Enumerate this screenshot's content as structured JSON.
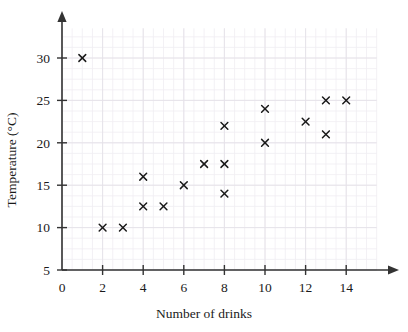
{
  "chart_data": {
    "type": "scatter",
    "title": "",
    "xlabel": "Number of drinks",
    "ylabel": "Temperature (°C)",
    "xlim": [
      0,
      15.5
    ],
    "ylim": [
      5,
      33.5
    ],
    "xticks": [
      0,
      2,
      4,
      6,
      8,
      10,
      12,
      14
    ],
    "yticks": [
      5,
      10,
      15,
      20,
      25,
      30
    ],
    "xtick_labels": [
      "0",
      "2",
      "4",
      "6",
      "8",
      "10",
      "12",
      "14"
    ],
    "ytick_labels": [
      "5",
      "10",
      "15",
      "20",
      "25",
      "30"
    ],
    "grid": true,
    "grid_minor_step_x": 0.5,
    "grid_minor_step_y": 1.25,
    "legend": "none",
    "marker": "x",
    "marker_color": "#1a1a1a",
    "points": [
      {
        "x": 1,
        "y": 30
      },
      {
        "x": 2,
        "y": 10
      },
      {
        "x": 3,
        "y": 10
      },
      {
        "x": 4,
        "y": 16
      },
      {
        "x": 4,
        "y": 12.5
      },
      {
        "x": 5,
        "y": 12.5
      },
      {
        "x": 6,
        "y": 15
      },
      {
        "x": 7,
        "y": 17.5
      },
      {
        "x": 8,
        "y": 22
      },
      {
        "x": 8,
        "y": 17.5
      },
      {
        "x": 8,
        "y": 14
      },
      {
        "x": 10,
        "y": 24
      },
      {
        "x": 10,
        "y": 20
      },
      {
        "x": 12,
        "y": 22.5
      },
      {
        "x": 13,
        "y": 25
      },
      {
        "x": 13,
        "y": 21
      },
      {
        "x": 14,
        "y": 25
      }
    ],
    "x": [
      1,
      2,
      3,
      4,
      4,
      5,
      6,
      7,
      8,
      8,
      8,
      10,
      10,
      12,
      13,
      13,
      14
    ],
    "values": [
      30,
      10,
      10,
      16,
      12.5,
      12.5,
      15,
      17.5,
      22,
      17.5,
      14,
      24,
      20,
      22.5,
      25,
      21,
      25
    ]
  },
  "colors": {
    "axis": "#333333",
    "marker": "#1a1a1a",
    "grid_minor": "#f0eef2",
    "grid_major": "#e4e1e8",
    "background": "#ffffff"
  }
}
